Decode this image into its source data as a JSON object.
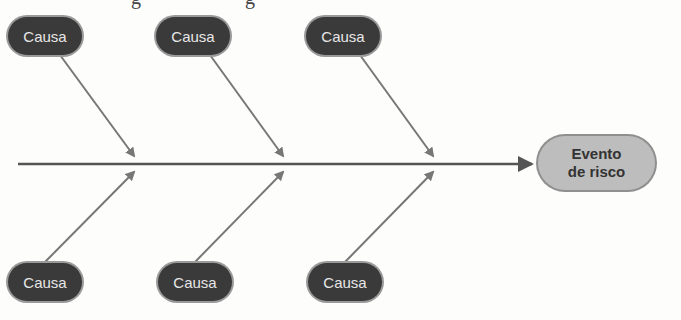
{
  "header_fragment": {
    "text_left": "g",
    "text_right": "g"
  },
  "diagram": {
    "type": "fishbone",
    "effect": {
      "line1": "Evento",
      "line2": "de risco"
    },
    "causes_top": [
      {
        "label": "Causa"
      },
      {
        "label": "Causa"
      },
      {
        "label": "Causa"
      }
    ],
    "causes_bottom": [
      {
        "label": "Causa"
      },
      {
        "label": "Causa"
      },
      {
        "label": "Causa"
      }
    ],
    "colors": {
      "cause_fill": "#3a3a3a",
      "effect_fill": "#bdbdbd",
      "arrow": "#777777",
      "spine": "#555555"
    }
  }
}
